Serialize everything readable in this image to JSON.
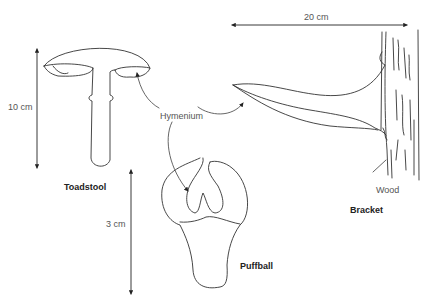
{
  "diagram": {
    "labels": {
      "hymenium": "Hymenium",
      "toadstool": "Toadstool",
      "puffball": "Puffball",
      "bracket": "Bracket",
      "wood": "Wood"
    },
    "dimensions": {
      "toadstool_height": "10 cm",
      "puffball_height": "3 cm",
      "bracket_width": "20 cm"
    },
    "colors": {
      "stroke": "#333333",
      "label": "#555555",
      "title": "#222222"
    }
  }
}
